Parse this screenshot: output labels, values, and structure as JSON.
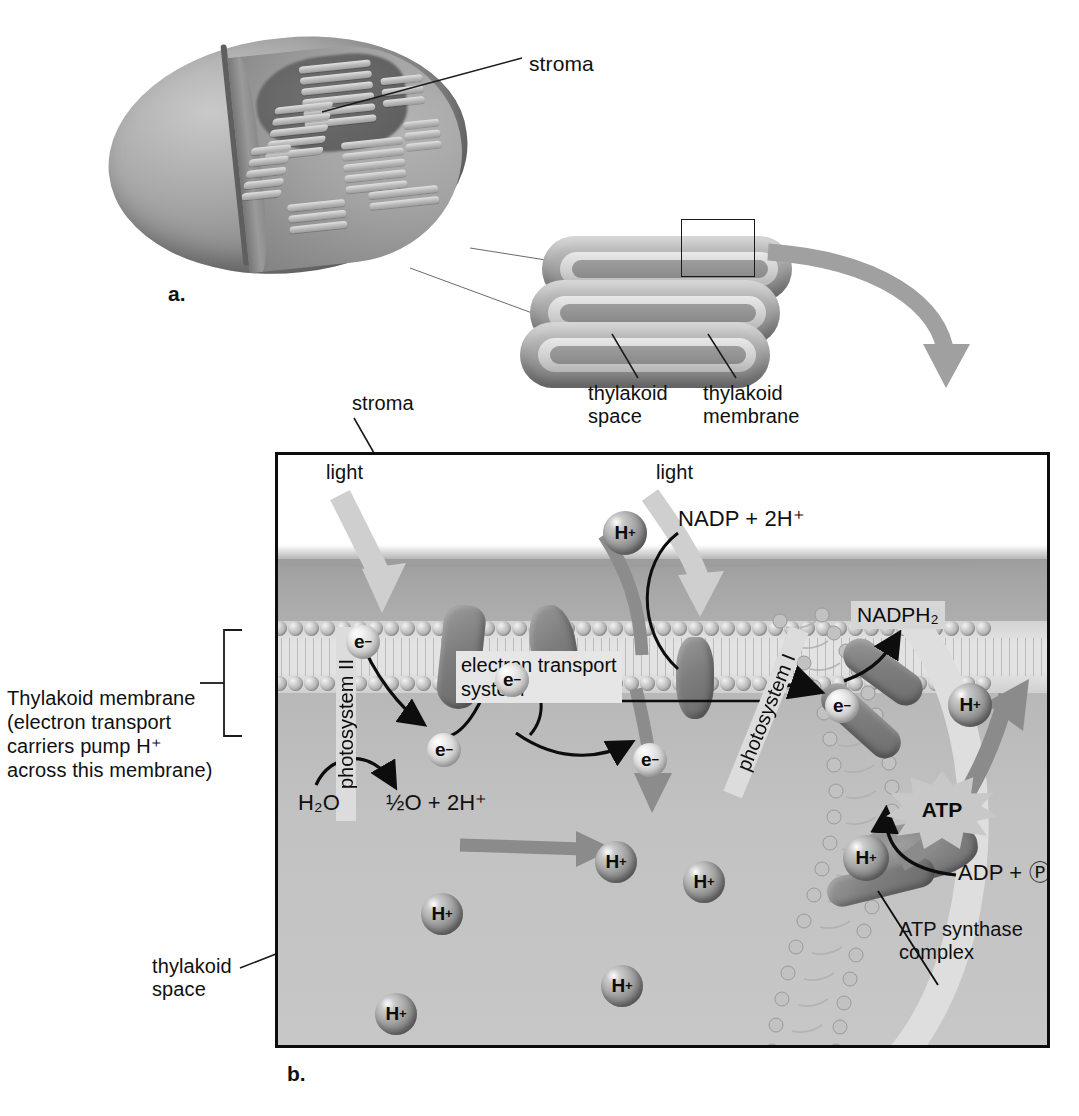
{
  "figure": {
    "panel_a_letter": "a.",
    "panel_b_letter": "b."
  },
  "panel_a": {
    "labels": {
      "stroma": "stroma"
    }
  },
  "stack": {
    "labels": {
      "thylakoid_space": "thylakoid\nspace",
      "thylakoid_membrane": "thylakoid\nmembrane"
    }
  },
  "panel_b": {
    "labels": {
      "stroma": "stroma",
      "light_left": "light",
      "light_right": "light",
      "thylakoid_membrane_note": "Thylakoid membrane\n(electron transport\ncarriers pump H⁺\nacross this membrane)",
      "thylakoid_space": "thylakoid\nspace",
      "atp_synthase_complex": "ATP synthase\ncomplex",
      "electron_transport_system": "electron transport\nsystem",
      "photosystem_2": "photosystem II",
      "photosystem_1": "photosystem I"
    },
    "reactions": {
      "water_split_reactant": "H₂O",
      "water_split_product": "½O + 2H⁺",
      "nadp_reactant": "NADP + 2H⁺",
      "nadph_product": "NADPH₂",
      "atp_product": "ATP",
      "adp_reactant": "ADP + Ⓟ"
    },
    "particles": {
      "proton_label": "H",
      "proton_charge": "+",
      "electron_label": "e",
      "electron_charge": "−",
      "protons": [
        {
          "id": "h-stroma-top",
          "x": 600,
          "y": 508,
          "d": 44
        },
        {
          "id": "h-stroma-mid",
          "x": 592,
          "y": 838,
          "d": 42
        },
        {
          "id": "h-space-a",
          "x": 680,
          "y": 858,
          "d": 42
        },
        {
          "id": "h-space-b",
          "x": 418,
          "y": 890,
          "d": 42
        },
        {
          "id": "h-space-c",
          "x": 598,
          "y": 962,
          "d": 42
        },
        {
          "id": "h-space-d",
          "x": 372,
          "y": 990,
          "d": 42
        },
        {
          "id": "h-synthase",
          "x": 840,
          "y": 832,
          "d": 46
        },
        {
          "id": "h-out-top",
          "x": 945,
          "y": 680,
          "d": 44
        }
      ],
      "electrons": [
        {
          "id": "e-ps2-top",
          "x": 343,
          "y": 622,
          "d": 34
        },
        {
          "id": "e-ps2-bot",
          "x": 424,
          "y": 730,
          "d": 34
        },
        {
          "id": "e-etc-mid",
          "x": 492,
          "y": 660,
          "d": 34
        },
        {
          "id": "e-etc-bot",
          "x": 630,
          "y": 740,
          "d": 34
        },
        {
          "id": "e-ps1",
          "x": 822,
          "y": 686,
          "d": 34
        }
      ]
    },
    "colors": {
      "box_border": "#0d0d0d",
      "stroma_fill": "#a6a6a6",
      "thylakoid_space_fill": "#c2c2c2",
      "membrane_fill": "#e3e3e3",
      "chip_bg": "#e6e6e6",
      "atp_star_bg": "#c8c8c8",
      "nadph_chip_bg": "#d6d6d6",
      "text": "#101010"
    }
  }
}
